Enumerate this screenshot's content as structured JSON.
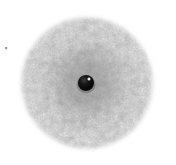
{
  "canvas": {
    "width": 176,
    "height": 165,
    "background_color": "#ffffff"
  },
  "scene": {
    "description": "Grayscale micrograph-style image: a large mottled gray textured disc on a white background with a small dark sphere at its center",
    "caption": ""
  },
  "disc": {
    "name": "textured gray disc",
    "center_x": 87,
    "center_y": 83,
    "radius": 67,
    "base_color": "#9a9a9a",
    "light_mottle_color": "#dcdcdc",
    "dark_mottle_color": "#5e5e5e",
    "mid_shadow_color": "#7d7d7d",
    "edge_feather_px": 4
  },
  "center_dot": {
    "name": "dark central sphere",
    "center_x": 86,
    "center_y": 83,
    "radius": 8,
    "color": "#0a0a0a",
    "rim_color": "#3a3a3a"
  },
  "highlight": {
    "name": "specular highlight",
    "center_x": 89,
    "center_y": 79,
    "radius": 2,
    "color": "#ffffff"
  },
  "speck": {
    "name": "small gray speck",
    "center_x": 6,
    "center_y": 48,
    "size": 2,
    "color": "#9c9c9c"
  },
  "chart_data": {
    "type": "heatmap",
    "title": "",
    "xlabel": "",
    "ylabel": "",
    "legend": [],
    "annotations": []
  }
}
